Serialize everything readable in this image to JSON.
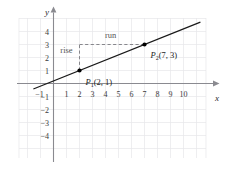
{
  "chart_data": {
    "type": "line",
    "title": "",
    "xlabel": "x",
    "ylabel": "y",
    "xlim": [
      -1.6,
      11.5
    ],
    "ylim": [
      -4.6,
      4.8
    ],
    "grid": true,
    "legend": null,
    "xticks": [
      -1,
      1,
      2,
      3,
      4,
      5,
      6,
      7,
      8,
      9,
      10
    ],
    "xtick_labels": [
      "-1",
      "1",
      "2",
      "3",
      "4",
      "5",
      "6",
      "7",
      "8",
      "9",
      "10"
    ],
    "yticks": [
      -4,
      -3,
      -2,
      -1,
      1,
      2,
      3,
      4
    ],
    "ytick_labels": [
      "-4",
      "-3",
      "-2",
      "-1",
      "1",
      "2",
      "3",
      "4"
    ],
    "series": [
      {
        "name": "line-through-P1-P2",
        "slope": 0.4,
        "intercept": 0.2,
        "x": [
          -1.55,
          11.3
        ],
        "y": [
          -0.42,
          4.72
        ]
      }
    ],
    "points": [
      {
        "name": "P1",
        "label": "P",
        "subscript": "1",
        "coords_text": "(2, 1)",
        "x": 2,
        "y": 1
      },
      {
        "name": "P2",
        "label": "P",
        "subscript": "2",
        "coords_text": "(7, 3)",
        "x": 7,
        "y": 3
      }
    ],
    "annotations": [
      {
        "name": "rise",
        "text": "rise",
        "x": 1.0,
        "y": 2.35
      },
      {
        "name": "run",
        "text": "run",
        "x": 4.4,
        "y": 3.5
      }
    ],
    "guides": [
      {
        "name": "rise-guide",
        "style": "dashed",
        "from": [
          2,
          1
        ],
        "to": [
          2,
          3
        ]
      },
      {
        "name": "run-guide",
        "style": "dashed",
        "from": [
          2,
          3
        ],
        "to": [
          7,
          3
        ]
      }
    ]
  },
  "colors": {
    "background": "#ffffff",
    "grid": "#e6e6ea",
    "grid_minor": "#f0f0f3",
    "axis": "#8a8a90",
    "line": "#1a1a1a",
    "point": "#000000",
    "dashed": "#7a7a80",
    "tick_text": "#3a3a3a",
    "annot_text": "#555555"
  }
}
